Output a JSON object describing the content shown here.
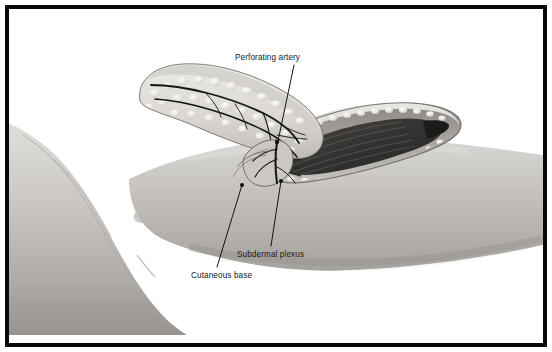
{
  "figure": {
    "kind": "medical-illustration",
    "palette": {
      "frame": "#0a0a0a",
      "background": "#ffffff",
      "skin_light": "#d8d6d3",
      "skin_mid": "#b9b6b2",
      "skin_shadow": "#8e8b88",
      "fat_light": "#e6e4e0",
      "fat_globule": "#f4f3f0",
      "muscle_dark": "#3d3b39",
      "muscle_mid": "#595653",
      "vessel": "#141414",
      "leader": "#141414",
      "label_text": "#18181a"
    }
  },
  "labels": [
    {
      "id": "perforating-artery",
      "text": "Perforating artery",
      "x": 226,
      "y": 44
    },
    {
      "id": "subdermal-plexus",
      "text": "Subdermal plexus",
      "x": 228,
      "y": 241
    },
    {
      "id": "cutaneous-base",
      "text": "Cutaneous base",
      "x": 182,
      "y": 262
    }
  ],
  "leader_lines": [
    {
      "id": "leader-perforating-artery",
      "from": [
        285,
        56
      ],
      "to": [
        268,
        133
      ]
    },
    {
      "id": "leader-subdermal-plexus",
      "from": [
        262,
        237
      ],
      "to": [
        272,
        172
      ]
    },
    {
      "id": "leader-cutaneous-base",
      "from": [
        208,
        258
      ],
      "to": [
        233,
        176
      ]
    }
  ],
  "anatomy": [
    {
      "id": "limb",
      "name": "flexed limb with skin surface"
    },
    {
      "id": "flap",
      "name": "elevated fasciocutaneous flap with subcutaneous fat"
    },
    {
      "id": "wound-bed",
      "name": "open wound bed exposing muscle"
    },
    {
      "id": "muscle",
      "name": "exposed muscle belly"
    },
    {
      "id": "pedicle",
      "name": "vascular pedicle at flap base"
    },
    {
      "id": "fat-lobules",
      "name": "subcutaneous fat lobules along wound margins"
    },
    {
      "id": "vessel-network",
      "name": "vessel branches coursing within the flap"
    }
  ]
}
